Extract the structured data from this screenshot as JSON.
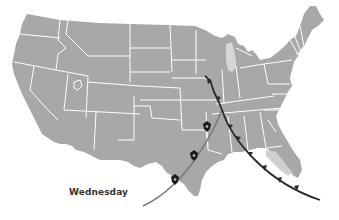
{
  "map": {
    "type": "weather-forecast-map",
    "region": "Contiguous United States",
    "day_label": "Wednesday",
    "colors": {
      "land": "#a8a8a8",
      "borders": "#ffffff",
      "lakes": "#d4d4d4",
      "cold_front": "#2a2a2a",
      "dry_line": "#7a7a7a",
      "storm_icon": "#1a1a1a",
      "background": "#ffffff"
    },
    "features": [
      {
        "kind": "cold-front",
        "description": "Dark front line with triangles from upper Midwest through Southeast to Florida"
      },
      {
        "kind": "squall-line",
        "description": "Grey line from Arkansas southwest through Texas"
      },
      {
        "kind": "storm-icons",
        "count": 3,
        "description": "Severe thunderstorm markers over Arkansas/Texas"
      }
    ]
  }
}
